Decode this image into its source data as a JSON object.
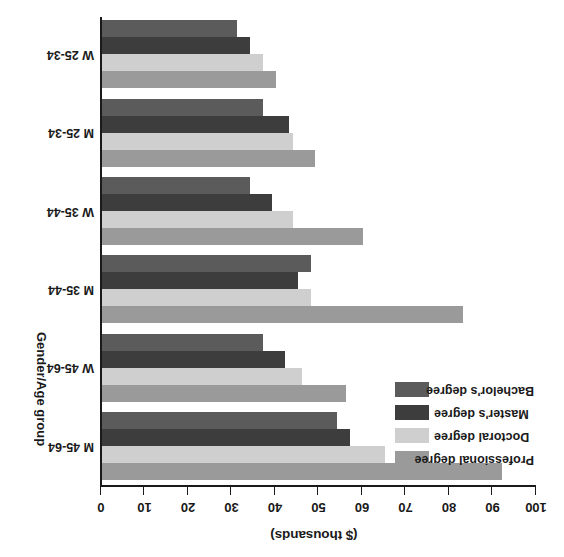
{
  "chart_data": {
    "type": "bar",
    "orientation": "horizontal",
    "title": "",
    "xlabel": "($ thousands)",
    "ylabel": "Gender/Age group",
    "xlim": [
      0,
      100
    ],
    "xticks": [
      0,
      10,
      20,
      30,
      40,
      50,
      60,
      70,
      80,
      90,
      100
    ],
    "xtick_labels": [
      "0",
      "10",
      "20",
      "30",
      "40",
      "50",
      "60",
      "70",
      "80",
      "90",
      "100"
    ],
    "grid": false,
    "legend_position": "upper-left",
    "rotation_degrees": 180,
    "categories": [
      "M 45-64",
      "W 45-64",
      "M 35-44",
      "W 35-44",
      "M 25-34",
      "W 25-34"
    ],
    "series": [
      {
        "name": "Professional degree",
        "color": "#9a9a9a",
        "values": [
          92,
          56,
          83,
          60,
          49,
          40
        ]
      },
      {
        "name": "Doctoral degree",
        "color": "#cfcfcf",
        "values": [
          65,
          46,
          48,
          44,
          44,
          37
        ]
      },
      {
        "name": "Master's degree",
        "color": "#3d3d3d",
        "values": [
          57,
          42,
          45,
          39,
          43,
          34
        ]
      },
      {
        "name": "Bachelor's degree",
        "color": "#5b5b5b",
        "values": [
          54,
          37,
          48,
          34,
          37,
          31
        ]
      }
    ]
  },
  "axes": {
    "value_axis_title": "($ thousands)",
    "category_axis_title": "Gender/Age group",
    "tick_labels": [
      "0",
      "10",
      "20",
      "30",
      "40",
      "50",
      "60",
      "70",
      "80",
      "90",
      "100"
    ]
  },
  "categories": [
    {
      "label": "M 45-64"
    },
    {
      "label": "W 45-64"
    },
    {
      "label": "M 35-44"
    },
    {
      "label": "W 35-44"
    },
    {
      "label": "M 25-34"
    },
    {
      "label": "W 25-34"
    }
  ],
  "legend": {
    "items": [
      {
        "label": "Professional degree",
        "color": "#9a9a9a"
      },
      {
        "label": "Doctoral degree",
        "color": "#cfcfcf"
      },
      {
        "label": "Master's degree",
        "color": "#3d3d3d"
      },
      {
        "label": "Bachelor's degree",
        "color": "#5b5b5b"
      }
    ]
  },
  "colors": {
    "professional": "#9a9a9a",
    "doctoral": "#cfcfcf",
    "masters": "#3d3d3d",
    "bachelors": "#5b5b5b",
    "axis": "#1a1a1a",
    "background": "#ffffff"
  }
}
